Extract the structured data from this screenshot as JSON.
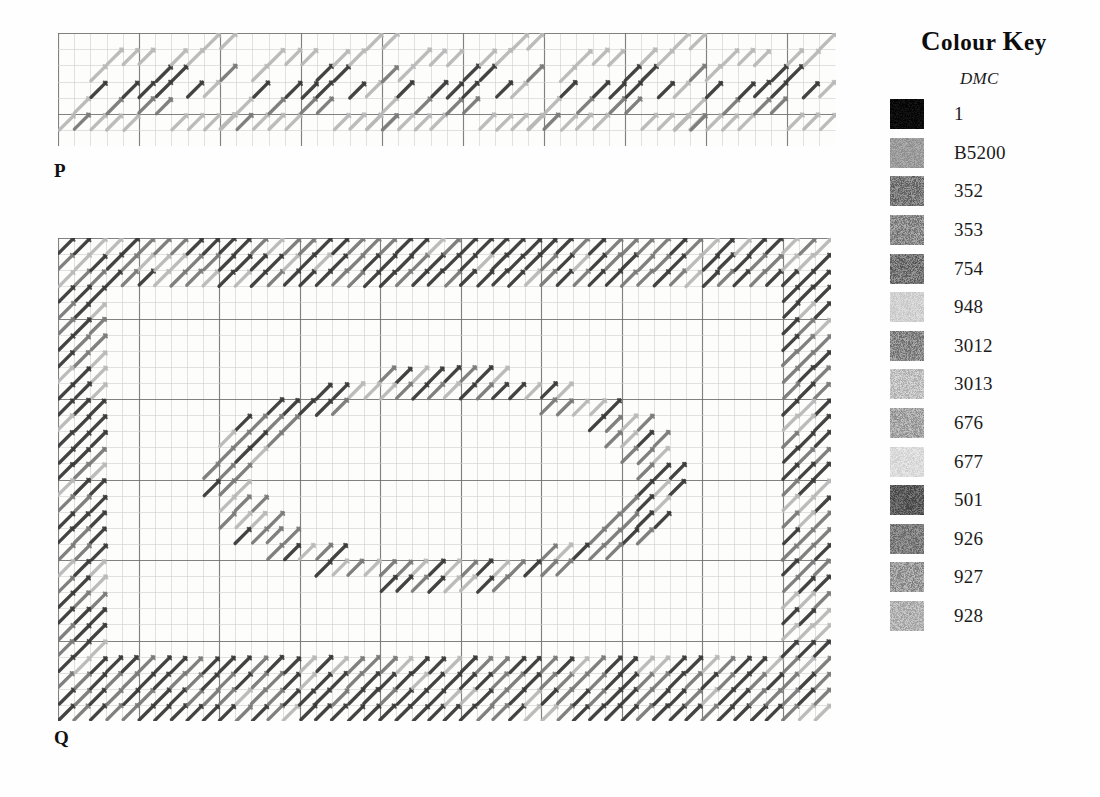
{
  "charts": [
    {
      "id": "chart-p",
      "label": "P",
      "left": 58,
      "top": 33,
      "cell": 16.2,
      "cols": 48,
      "rows": 7,
      "bold_every": 5,
      "label_left": 54,
      "label_top": 160,
      "description": "Repeating diagonal border motif band",
      "stitches": [
        {
          "c": 1,
          "r": 4,
          "tone": "pale"
        },
        {
          "c": 2,
          "r": 5,
          "tone": "pale"
        },
        {
          "c": 2,
          "r": 2,
          "tone": "pale"
        },
        {
          "c": 3,
          "r": 1,
          "tone": "pale"
        },
        {
          "c": 3,
          "r": 4,
          "tone": "mid"
        },
        {
          "c": 3,
          "r": 5,
          "tone": "pale"
        },
        {
          "c": 4,
          "r": 1,
          "tone": "pale"
        },
        {
          "c": 4,
          "r": 3,
          "tone": "dark"
        },
        {
          "c": 4,
          "r": 5,
          "tone": "pale"
        },
        {
          "c": 5,
          "r": 1,
          "tone": "pale"
        },
        {
          "c": 5,
          "r": 3,
          "tone": "dark"
        },
        {
          "c": 5,
          "r": 4,
          "tone": "mid"
        },
        {
          "c": 2,
          "r": 3,
          "tone": "dark"
        },
        {
          "c": 6,
          "r": 2,
          "tone": "dark"
        },
        {
          "c": 6,
          "r": 4,
          "tone": "mid"
        },
        {
          "c": 7,
          "r": 2,
          "tone": "dark"
        },
        {
          "c": 7,
          "r": 1,
          "tone": "pale"
        },
        {
          "c": 7,
          "r": 5,
          "tone": "pale"
        },
        {
          "c": 8,
          "r": 1,
          "tone": "pale"
        },
        {
          "c": 8,
          "r": 3,
          "tone": "dark"
        },
        {
          "c": 8,
          "r": 5,
          "tone": "pale"
        },
        {
          "c": 6,
          "r": 3,
          "tone": "dark"
        },
        {
          "c": 9,
          "r": 0,
          "tone": "pale"
        },
        {
          "c": 9,
          "r": 3,
          "tone": "pale"
        },
        {
          "c": 10,
          "r": 0,
          "tone": "pale"
        },
        {
          "c": 10,
          "r": 2,
          "tone": "mid"
        },
        {
          "c": 1,
          "r": 5,
          "tone": "mid"
        },
        {
          "c": 0,
          "r": 5,
          "tone": "pale"
        },
        {
          "c": 9,
          "r": 5,
          "tone": "pale"
        },
        {
          "c": 10,
          "r": 5,
          "tone": "pale"
        }
      ],
      "repeat_cols": 9.6,
      "repeats": 5
    },
    {
      "id": "chart-q",
      "label": "Q",
      "left": 58,
      "top": 238,
      "cell": 16.1,
      "cols": 48,
      "rows": 30,
      "bold_every": 5,
      "label_left": 54,
      "label_top": 727,
      "description": "Rectangular border frame with central oval medallion"
    }
  ],
  "grid_colors": {
    "fine": "#cfcfce",
    "bold": "#6f6f6e",
    "paper": "#fdfdfc"
  },
  "stitch_tones": {
    "dark": "#3a3a3a",
    "mid": "#7a7a7a",
    "pale": "#b9b9b9"
  },
  "colour_key": {
    "title_small_caps": "Colour key",
    "title_parts": {
      "c1": "C",
      "rest1": "olour",
      "c2": "K",
      "rest2": "ey"
    },
    "subtitle": "DMC",
    "entries": [
      {
        "code": "1",
        "swatch": "#0b0b0b",
        "grain": 0.1
      },
      {
        "code": "B5200",
        "swatch": "#9d9d9d",
        "grain": 0.16
      },
      {
        "code": "352",
        "swatch": "#7c7c7c",
        "grain": 0.3
      },
      {
        "code": "353",
        "swatch": "#8d8d8d",
        "grain": 0.3
      },
      {
        "code": "754",
        "swatch": "#767676",
        "grain": 0.32
      },
      {
        "code": "948",
        "swatch": "#d2d2d2",
        "grain": 0.12
      },
      {
        "code": "3012",
        "swatch": "#8a8a8a",
        "grain": 0.3
      },
      {
        "code": "3013",
        "swatch": "#c2c2c2",
        "grain": 0.22
      },
      {
        "code": "676",
        "swatch": "#a6a6a6",
        "grain": 0.26
      },
      {
        "code": "677",
        "swatch": "#dcdcdc",
        "grain": 0.12
      },
      {
        "code": "501",
        "swatch": "#5e5e5e",
        "grain": 0.26
      },
      {
        "code": "926",
        "swatch": "#7f7f7f",
        "grain": 0.26
      },
      {
        "code": "927",
        "swatch": "#9c9c9c",
        "grain": 0.28
      },
      {
        "code": "928",
        "swatch": "#b4b4b4",
        "grain": 0.22
      }
    ]
  }
}
